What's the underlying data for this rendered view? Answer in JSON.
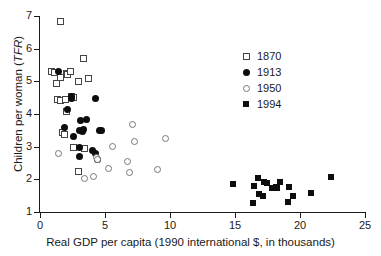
{
  "chart_data": {
    "type": "scatter",
    "title": "",
    "xlabel": "Real GDP per capita (1990 international $, in thousands)",
    "ylabel": "Children per woman (TFR)",
    "ylabel_plain": "Children per woman (",
    "ylabel_italic": "TFR",
    "ylabel_tail": ")",
    "xlim": [
      0,
      25
    ],
    "ylim": [
      1,
      7
    ],
    "xticks": [
      0,
      5,
      10,
      15,
      20,
      25
    ],
    "yticks": [
      1,
      2,
      3,
      4,
      5,
      6,
      7
    ],
    "grid": false,
    "legend_position": "upper-right-inside",
    "series": [
      {
        "name": "1870",
        "marker": "open-square",
        "color": "#444444",
        "points": [
          [
            1.6,
            6.83
          ],
          [
            0.85,
            5.3
          ],
          [
            1.15,
            5.28
          ],
          [
            1.25,
            4.92
          ],
          [
            1.55,
            5.12
          ],
          [
            2.05,
            5.25
          ],
          [
            2.15,
            5.22
          ],
          [
            2.35,
            5.3
          ],
          [
            2.95,
            5.0
          ],
          [
            3.35,
            5.7
          ],
          [
            3.75,
            5.1
          ],
          [
            1.35,
            4.45
          ],
          [
            1.55,
            4.42
          ],
          [
            1.95,
            4.45
          ],
          [
            2.05,
            4.08
          ],
          [
            2.45,
            4.55
          ],
          [
            2.55,
            4.5
          ],
          [
            1.75,
            3.42
          ],
          [
            1.85,
            3.38
          ],
          [
            2.55,
            2.98
          ],
          [
            2.95,
            2.25
          ],
          [
            3.45,
            2.95
          ]
        ]
      },
      {
        "name": "1913",
        "marker": "filled-circle",
        "color": "#0d0d0d",
        "points": [
          [
            1.45,
            5.3
          ],
          [
            2.45,
            4.55
          ],
          [
            2.45,
            4.48
          ],
          [
            2.15,
            4.15
          ],
          [
            1.85,
            3.58
          ],
          [
            2.55,
            3.3
          ],
          [
            3.15,
            3.8
          ],
          [
            3.55,
            3.82
          ],
          [
            3.05,
            3.5
          ],
          [
            3.25,
            3.45
          ],
          [
            3.35,
            3.52
          ],
          [
            4.25,
            4.48
          ],
          [
            4.55,
            3.5
          ],
          [
            4.75,
            3.5
          ],
          [
            3.05,
            2.98
          ],
          [
            3.05,
            2.7
          ],
          [
            4.05,
            2.88
          ],
          [
            4.25,
            2.78
          ],
          [
            4.45,
            2.62
          ]
        ]
      },
      {
        "name": "1950",
        "marker": "open-circle",
        "color": "#777777",
        "points": [
          [
            1.45,
            2.78
          ],
          [
            3.45,
            2.02
          ],
          [
            4.15,
            2.1
          ],
          [
            4.35,
            2.68
          ],
          [
            4.45,
            2.62
          ],
          [
            5.25,
            2.32
          ],
          [
            5.55,
            3.02
          ],
          [
            6.75,
            2.55
          ],
          [
            6.85,
            2.22
          ],
          [
            7.15,
            3.68
          ],
          [
            7.25,
            3.15
          ],
          [
            9.05,
            2.3
          ],
          [
            9.65,
            3.25
          ]
        ]
      },
      {
        "name": "1994",
        "marker": "filled-square",
        "color": "#0d0d0d",
        "points": [
          [
            14.85,
            1.85
          ],
          [
            16.35,
            1.28
          ],
          [
            16.45,
            1.8
          ],
          [
            16.75,
            2.05
          ],
          [
            16.85,
            1.55
          ],
          [
            17.15,
            1.5
          ],
          [
            17.25,
            1.92
          ],
          [
            17.45,
            1.88
          ],
          [
            17.85,
            1.72
          ],
          [
            18.15,
            1.78
          ],
          [
            18.25,
            1.75
          ],
          [
            18.45,
            1.92
          ],
          [
            19.05,
            1.3
          ],
          [
            19.15,
            1.78
          ],
          [
            19.45,
            1.5
          ],
          [
            20.85,
            1.58
          ],
          [
            22.35,
            2.07
          ]
        ]
      }
    ]
  },
  "axes": {
    "x_tick_labels": [
      "0",
      "5",
      "10",
      "15",
      "20",
      "25"
    ],
    "y_tick_labels": [
      "1",
      "2",
      "3",
      "4",
      "5",
      "6",
      "7"
    ]
  },
  "legend": {
    "items": [
      {
        "label": "1870",
        "marker": "open-square"
      },
      {
        "label": "1913",
        "marker": "filled-circle"
      },
      {
        "label": "1950",
        "marker": "open-circle"
      },
      {
        "label": "1994",
        "marker": "filled-square"
      }
    ]
  }
}
